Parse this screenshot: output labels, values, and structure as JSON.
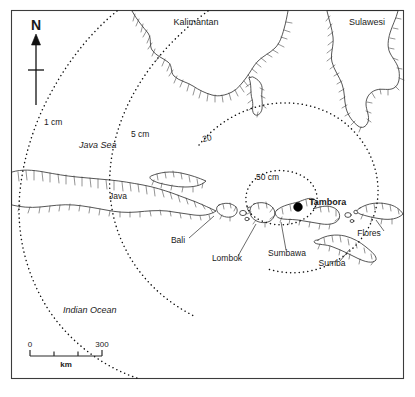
{
  "figure": {
    "kind": "ashfall-isopach-map",
    "region": "Indonesia / Lesser Sunda Islands"
  },
  "compass": {
    "label": "N",
    "icon": "north-arrow-icon"
  },
  "regions": [
    {
      "id": "kalimantan",
      "label": "Kalimantan",
      "x": 196,
      "y": 22
    },
    {
      "id": "sulawesi",
      "label": "Sulawesi",
      "x": 367,
      "y": 22
    },
    {
      "id": "java",
      "label": "Java",
      "x": 118,
      "y": 196
    },
    {
      "id": "bali",
      "label": "Bali",
      "x": 178,
      "y": 243
    },
    {
      "id": "lombok",
      "label": "Lombok",
      "x": 227,
      "y": 261
    },
    {
      "id": "sumbawa",
      "label": "Sumbawa",
      "x": 287,
      "y": 256
    },
    {
      "id": "flores",
      "label": "Flores",
      "x": 369,
      "y": 236
    },
    {
      "id": "sumba",
      "label": "Sumba",
      "x": 332,
      "y": 266
    }
  ],
  "seas": [
    {
      "id": "java-sea",
      "label": "Java Sea",
      "x": 79,
      "y": 148
    },
    {
      "id": "indian-ocean",
      "label": "Indian Ocean",
      "x": 87,
      "y": 313
    }
  ],
  "volcano": {
    "name": "Tambora",
    "label": "Tambora",
    "marker": "filled-circle",
    "x": 298,
    "y": 207,
    "label_x": 310,
    "label_y": 205
  },
  "contours": {
    "unit": "cm",
    "caption": "ashfall thickness isopachs",
    "lines": [
      {
        "id": "contour-1cm",
        "label": "1 cm",
        "value": 1,
        "label_x": 44,
        "label_y": 125
      },
      {
        "id": "contour-5cm",
        "label": "5 cm",
        "value": 5,
        "label_x": 131,
        "label_y": 137
      },
      {
        "id": "contour-20cm",
        "label": "20",
        "value": 20,
        "label_x": 203,
        "label_y": 142
      },
      {
        "id": "contour-50cm",
        "label": "50 cm",
        "value": 50,
        "label_x": 256,
        "label_y": 180
      }
    ]
  },
  "scale_bar": {
    "min_label": "0",
    "max_label": "300",
    "unit_label": "km",
    "min_value": 0,
    "max_value": 300,
    "divisions": 3
  },
  "colors": {
    "ink": "#111111",
    "coast_stroke": "#2b2b2b",
    "frame": "#3c3c3c",
    "background": "#ffffff"
  }
}
